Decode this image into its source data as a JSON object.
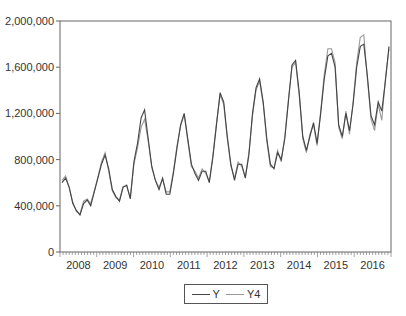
{
  "chart_data": {
    "type": "line",
    "title": "",
    "xlabel": "",
    "ylabel": "",
    "ylim": [
      0,
      2000000
    ],
    "yticks": [
      0,
      400000,
      800000,
      1200000,
      1600000,
      2000000
    ],
    "ytick_labels": [
      "0",
      "400,000",
      "800,000",
      "1,200,000",
      "1,600,000",
      "2,000,000"
    ],
    "xtick_labels": [
      "2008",
      "2009",
      "2010",
      "2011",
      "2012",
      "2013",
      "2014",
      "2015",
      "2016"
    ],
    "grid": false,
    "legend_position": "bottom-center",
    "x_frequency": "bi-monthly (approx.)",
    "series": [
      {
        "name": "Y",
        "color": "#444444",
        "values": [
          600000,
          640000,
          560000,
          420000,
          360000,
          320000,
          420000,
          450000,
          400000,
          520000,
          640000,
          760000,
          840000,
          720000,
          540000,
          480000,
          440000,
          560000,
          580000,
          460000,
          780000,
          940000,
          1160000,
          1230000,
          980000,
          740000,
          620000,
          540000,
          640000,
          500000,
          500000,
          680000,
          900000,
          1100000,
          1200000,
          980000,
          760000,
          680000,
          620000,
          700000,
          700000,
          600000,
          820000,
          1100000,
          1380000,
          1300000,
          1000000,
          760000,
          620000,
          760000,
          760000,
          640000,
          840000,
          1200000,
          1420000,
          1500000,
          1300000,
          980000,
          760000,
          720000,
          860000,
          800000,
          980000,
          1300000,
          1620000,
          1660000,
          1380000,
          1000000,
          880000,
          1000000,
          1120000,
          940000,
          1200000,
          1500000,
          1700000,
          1720000,
          1600000,
          1100000,
          1000000,
          1200000,
          1050000,
          1280000,
          1600000,
          1780000,
          1800000,
          1520000,
          1180000,
          1100000,
          1300000,
          1220000,
          1480000,
          1780000
        ]
      },
      {
        "name": "Y4",
        "color": "#999999",
        "values": [
          620000,
          660000,
          560000,
          430000,
          350000,
          330000,
          440000,
          460000,
          420000,
          530000,
          650000,
          780000,
          860000,
          700000,
          530000,
          470000,
          450000,
          570000,
          570000,
          470000,
          760000,
          900000,
          1080000,
          1150000,
          960000,
          730000,
          620000,
          560000,
          630000,
          520000,
          520000,
          700000,
          920000,
          1090000,
          1190000,
          960000,
          740000,
          700000,
          640000,
          720000,
          680000,
          610000,
          840000,
          1120000,
          1360000,
          1280000,
          980000,
          740000,
          640000,
          780000,
          740000,
          650000,
          860000,
          1180000,
          1400000,
          1480000,
          1280000,
          960000,
          740000,
          730000,
          880000,
          780000,
          1000000,
          1320000,
          1600000,
          1640000,
          1360000,
          980000,
          860000,
          1020000,
          1100000,
          920000,
          1220000,
          1540000,
          1760000,
          1760000,
          1640000,
          1080000,
          980000,
          1220000,
          1020000,
          1300000,
          1640000,
          1860000,
          1880000,
          1500000,
          1150000,
          1050000,
          1280000,
          1140000,
          1500000,
          1760000
        ]
      }
    ]
  },
  "legend": {
    "items": [
      {
        "label": "Y",
        "color": "#444444"
      },
      {
        "label": "Y4",
        "color": "#999999"
      }
    ]
  }
}
